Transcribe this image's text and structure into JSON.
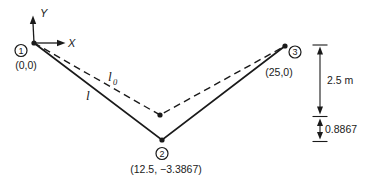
{
  "figure": {
    "colors": {
      "ink": "#1a1a1a",
      "background": "#ffffff"
    },
    "axes": {
      "x_label": "X",
      "y_label": "Y"
    },
    "nodes": [
      {
        "number": "1",
        "coords": "(0,0)"
      },
      {
        "number": "2",
        "coords": "(12.5, −3.3867)"
      },
      {
        "number": "3",
        "coords": "(25,0)"
      }
    ],
    "members": {
      "deformed_label": "l",
      "undeformed_label": "l",
      "undeformed_label_sub": "0"
    },
    "dimensions": {
      "span_depth": "2.5 m",
      "deflection": "0.8867"
    }
  }
}
